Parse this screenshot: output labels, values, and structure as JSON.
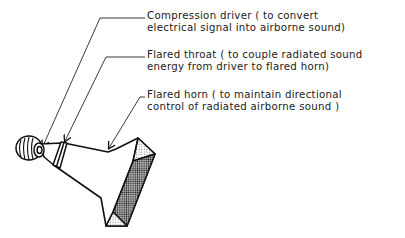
{
  "diagram": {
    "type": "labeled-illustration",
    "labels": [
      {
        "id": "compression-driver",
        "line1": "Compression driver ( to convert",
        "line2": "electrical signal into airborne sound)"
      },
      {
        "id": "flared-throat",
        "line1": "Flared throat ( to couple radiated sound",
        "line2": "energy from driver to flared horn)"
      },
      {
        "id": "flared-horn",
        "line1": "Flared horn ( to maintain directional",
        "line2": "control of radiated airborne sound )"
      }
    ],
    "colors": {
      "ink": "#111111",
      "background": "#ffffff",
      "mouth_shade_dark": "#555555",
      "mouth_shade_light": "#cfcfcf"
    }
  }
}
